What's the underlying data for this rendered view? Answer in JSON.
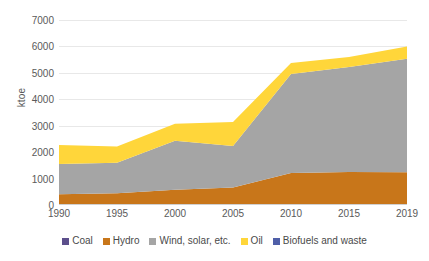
{
  "chart_data": {
    "type": "area",
    "stacked": true,
    "title": "",
    "xlabel": "",
    "ylabel": "ktoe",
    "x": [
      1990,
      1995,
      2000,
      2005,
      2010,
      2015,
      2019
    ],
    "xtick_labels": [
      "1990",
      "1995",
      "2000",
      "2005",
      "2010",
      "2015",
      "2019"
    ],
    "ytick_labels": [
      "0",
      "1000",
      "2000",
      "3000",
      "4000",
      "5000",
      "6000",
      "7000"
    ],
    "ytick_values": [
      0,
      1000,
      2000,
      3000,
      4000,
      5000,
      6000,
      7000
    ],
    "ylim": [
      0,
      7000
    ],
    "xlim": [
      1990,
      2019
    ],
    "grid": true,
    "legend_position": "bottom",
    "series": [
      {
        "name": "Coal",
        "color": "#5c4f8c",
        "values": [
          40,
          40,
          40,
          40,
          40,
          40,
          40
        ]
      },
      {
        "name": "Hydro",
        "color": "#c8761a",
        "values": [
          370,
          400,
          540,
          620,
          1170,
          1210,
          1200
        ]
      },
      {
        "name": "Wind, solar, etc.",
        "color": "#a5a5a5",
        "values": [
          1140,
          1160,
          1850,
          1570,
          3750,
          3970,
          4290
        ]
      },
      {
        "name": "Oil",
        "color": "#ffd63a",
        "values": [
          720,
          610,
          640,
          910,
          410,
          380,
          470
        ]
      },
      {
        "name": "Biofuels and waste",
        "color": "#4f5fa8",
        "values": [
          0,
          0,
          0,
          0,
          0,
          0,
          0
        ]
      }
    ],
    "totals": [
      2270,
      2210,
      3070,
      3140,
      5370,
      5600,
      6000
    ]
  },
  "legend": {
    "items": [
      {
        "label": "Coal",
        "color": "#5c4f8c"
      },
      {
        "label": "Hydro",
        "color": "#c8761a"
      },
      {
        "label": "Wind, solar, etc.",
        "color": "#a5a5a5"
      },
      {
        "label": "Oil",
        "color": "#ffd63a"
      },
      {
        "label": "Biofuels and waste",
        "color": "#4f5fa8"
      }
    ]
  }
}
